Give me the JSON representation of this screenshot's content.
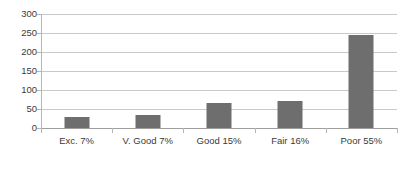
{
  "chart_data": {
    "type": "bar",
    "title": "",
    "subtitle": "",
    "xlabel": "",
    "ylabel": "",
    "categories": [
      "Exc. 7%",
      "V. Good 7%",
      "Good 15%",
      "Fair 16%",
      "Poor 55%"
    ],
    "values": [
      29,
      34,
      67,
      71,
      246
    ],
    "ylim": [
      0,
      300
    ],
    "yticks": [
      0,
      50,
      100,
      150,
      200,
      250,
      300
    ],
    "ytick_labels": [
      "0",
      "50",
      "100",
      "150",
      "200",
      "250",
      "300"
    ],
    "grid": "horizontal",
    "legend": "none",
    "series": [
      {
        "name": "Count",
        "values": [
          29,
          34,
          67,
          71,
          246
        ]
      }
    ],
    "colors": {
      "bar_fill": "#6e6e6e",
      "gridline": "#c9c9c9",
      "axis": "#9e9e9e",
      "tick_text": "#3a3a3a",
      "background": "#ffffff"
    }
  }
}
